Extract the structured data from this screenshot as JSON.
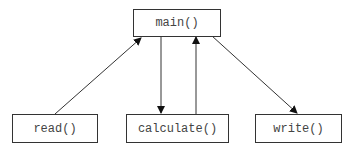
{
  "diagram": {
    "nodes": [
      {
        "id": "main",
        "label": "main()"
      },
      {
        "id": "read",
        "label": "read()"
      },
      {
        "id": "calculate",
        "label": "calculate()"
      },
      {
        "id": "write",
        "label": "write()"
      }
    ],
    "edges": [
      {
        "from": "read",
        "to": "main"
      },
      {
        "from": "main",
        "to": "calculate"
      },
      {
        "from": "calculate",
        "to": "main"
      },
      {
        "from": "main",
        "to": "write"
      }
    ]
  }
}
